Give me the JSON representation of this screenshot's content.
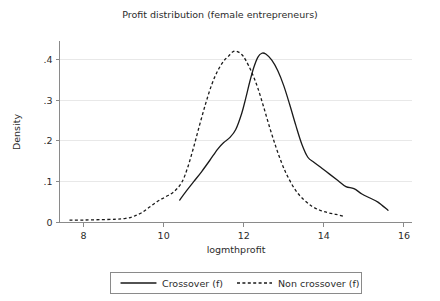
{
  "chart_data": {
    "type": "line",
    "title": "Profit distribution (female entrepreneurs)",
    "xlabel": "logmthprofit",
    "ylabel": "Density",
    "xlim": [
      7.4,
      16.2
    ],
    "ylim": [
      0,
      0.445
    ],
    "grid": true,
    "grid_axis": "y",
    "legend_position": "bottom",
    "xticks": [
      8,
      10,
      12,
      14,
      16
    ],
    "xtick_labels": [
      "8",
      "10",
      "12",
      "14",
      "16"
    ],
    "yticks": [
      0,
      0.1,
      0.2,
      0.3,
      0.4
    ],
    "ytick_labels": [
      "0",
      ".1",
      ".2",
      ".3",
      ".4"
    ],
    "series": [
      {
        "name": "Crossover (f)",
        "style": "solid",
        "color": "#1a1a1a",
        "x": [
          10.4,
          10.55,
          10.75,
          10.95,
          11.15,
          11.35,
          11.5,
          11.65,
          11.8,
          11.95,
          12.05,
          12.15,
          12.25,
          12.35,
          12.45,
          12.55,
          12.7,
          12.85,
          13.0,
          13.15,
          13.3,
          13.45,
          13.6,
          13.75,
          13.95,
          14.15,
          14.35,
          14.55,
          14.75,
          14.95,
          15.15,
          15.35,
          15.6
        ],
        "y": [
          0.055,
          0.075,
          0.1,
          0.125,
          0.152,
          0.18,
          0.196,
          0.208,
          0.228,
          0.268,
          0.305,
          0.345,
          0.38,
          0.405,
          0.415,
          0.413,
          0.398,
          0.372,
          0.335,
          0.288,
          0.238,
          0.192,
          0.16,
          0.148,
          0.133,
          0.118,
          0.103,
          0.088,
          0.083,
          0.07,
          0.06,
          0.05,
          0.03
        ]
      },
      {
        "name": "Non crossover (f)",
        "style": "dashed",
        "color": "#1a1a1a",
        "x": [
          7.65,
          8.0,
          8.4,
          8.8,
          9.05,
          9.25,
          9.45,
          9.65,
          9.85,
          10.05,
          10.25,
          10.45,
          10.6,
          10.75,
          10.9,
          11.05,
          11.2,
          11.35,
          11.5,
          11.62,
          11.72,
          11.82,
          11.95,
          12.05,
          12.2,
          12.35,
          12.5,
          12.65,
          12.8,
          12.95,
          13.1,
          13.3,
          13.5,
          13.7,
          13.9,
          14.1,
          14.3,
          14.5
        ],
        "y": [
          0.006,
          0.006,
          0.007,
          0.008,
          0.01,
          0.015,
          0.024,
          0.038,
          0.052,
          0.063,
          0.075,
          0.098,
          0.135,
          0.185,
          0.24,
          0.292,
          0.338,
          0.372,
          0.396,
          0.408,
          0.418,
          0.42,
          0.412,
          0.398,
          0.368,
          0.33,
          0.282,
          0.232,
          0.186,
          0.145,
          0.112,
          0.078,
          0.056,
          0.04,
          0.03,
          0.024,
          0.02,
          0.015
        ]
      }
    ]
  },
  "legend": {
    "entries": [
      {
        "label": "Crossover (f)",
        "style": "solid"
      },
      {
        "label": "Non crossover (f)",
        "style": "dashed"
      }
    ]
  }
}
